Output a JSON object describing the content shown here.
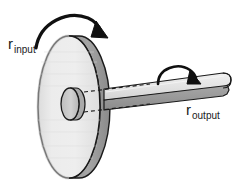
{
  "figure": {
    "background_color": "#ffffff",
    "width": 235,
    "height": 188
  },
  "labels": {
    "input": {
      "base": "r",
      "subscript": "input"
    },
    "output": {
      "base": "r",
      "subscript": "output"
    }
  },
  "parts": {
    "wheel": {
      "name": "large-wheel-disk",
      "face_color": "#e9e9e9",
      "rim_color": "#9b9b9b",
      "outline_color": "#1a1a1a",
      "center_x": 69,
      "center_y": 107,
      "radius_x": 31,
      "radius_y": 71
    },
    "hub": {
      "name": "wheel-hub",
      "face_color": "#c9c9c9",
      "side_color": "#aaaaaa",
      "outline_color": "#1a1a1a",
      "center_x": 76,
      "center_y": 104,
      "radius_x": 9,
      "radius_y": 16
    },
    "shaft": {
      "name": "output-shaft",
      "top_color": "#e2e2e2",
      "side_color": "#9b9b9b",
      "outline_color": "#1a1a1a",
      "start_x": 104,
      "start_y": 96,
      "end_x": 227,
      "end_y": 80
    },
    "dashed_axis": {
      "name": "axis-dashed-lines",
      "color": "#1a1a1a",
      "dash": "4 3"
    }
  },
  "arrows": {
    "input_rotation": {
      "name": "input-rotation-arrow",
      "color": "#1a1a1a",
      "direction": "clockwise-over-wheel"
    },
    "output_rotation": {
      "name": "output-rotation-arrow",
      "color": "#1a1a1a",
      "direction": "clockwise-over-shaft"
    }
  }
}
